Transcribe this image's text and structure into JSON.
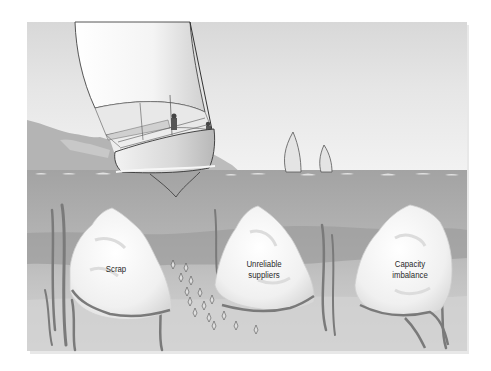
{
  "illustration": {
    "description": "Sailboat on water with hidden rocks beneath the surface representing problems",
    "colors": {
      "sky_top": "#dcdcdc",
      "sky_bottom": "#f0f0f0",
      "water_top": "#a6a6a6",
      "water_bottom": "#d4d4d4",
      "rock": "#f4f4f4",
      "seaweed": "#7a7a7a",
      "hills": "#b4b4b4"
    },
    "rocks": [
      {
        "id": "scrap",
        "label": "Scrap"
      },
      {
        "id": "unreliable-suppliers",
        "label": "Unreliable\nsuppliers"
      },
      {
        "id": "capacity-imbalance",
        "label": "Capacity\nimbalance"
      }
    ]
  }
}
